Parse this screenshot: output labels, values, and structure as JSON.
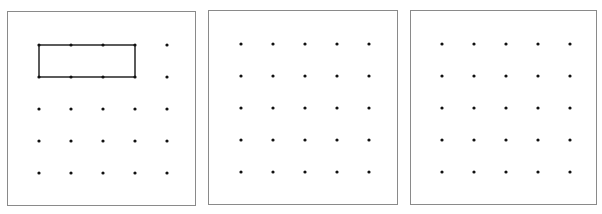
{
  "figure": {
    "corner_label": "",
    "colors": {
      "frame": "#8a8a8a",
      "dot": "#111111",
      "shape_stroke": "#333333"
    },
    "grid": {
      "rows": 5,
      "cols": 5,
      "spacing_px": 32
    },
    "panels": [
      {
        "id": "panel-1",
        "box": {
          "left": 7,
          "top": 11,
          "width": 189,
          "height": 195
        },
        "grid_origin": {
          "x": 31,
          "y": 33
        },
        "shape": {
          "type": "rectangle",
          "from": {
            "col": 0,
            "row": 0
          },
          "to": {
            "col": 3,
            "row": 1
          }
        }
      },
      {
        "id": "panel-2",
        "box": {
          "left": 208,
          "top": 10,
          "width": 190,
          "height": 195
        },
        "grid_origin": {
          "x": 32,
          "y": 33
        },
        "shape": null
      },
      {
        "id": "panel-3",
        "box": {
          "left": 410,
          "top": 10,
          "width": 187,
          "height": 195
        },
        "grid_origin": {
          "x": 31,
          "y": 33
        },
        "shape": null
      }
    ]
  }
}
